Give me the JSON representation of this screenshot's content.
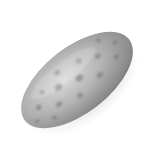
{
  "image": {
    "subject": "speckled elongated egg",
    "background_color": "#ffffff",
    "colors": {
      "highlight": "#d6d6d6",
      "mid": "#a8a8a8",
      "shadow": "#5e5e5e",
      "spot": "#6f6f6f"
    }
  }
}
